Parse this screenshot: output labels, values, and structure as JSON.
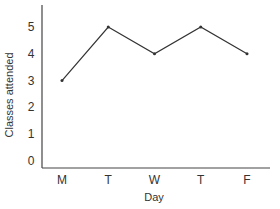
{
  "chart_data": {
    "type": "line",
    "title": "",
    "xlabel": "Day",
    "ylabel": "Classes attended",
    "categories": [
      "M",
      "T",
      "W",
      "T",
      "F"
    ],
    "values": [
      3,
      5,
      4,
      5,
      4
    ],
    "yticks": [
      "0",
      "1",
      "2",
      "3",
      "4",
      "5"
    ],
    "ylim": [
      0,
      5.9
    ],
    "grid": false,
    "legend": "none",
    "line_color": "#333333"
  }
}
